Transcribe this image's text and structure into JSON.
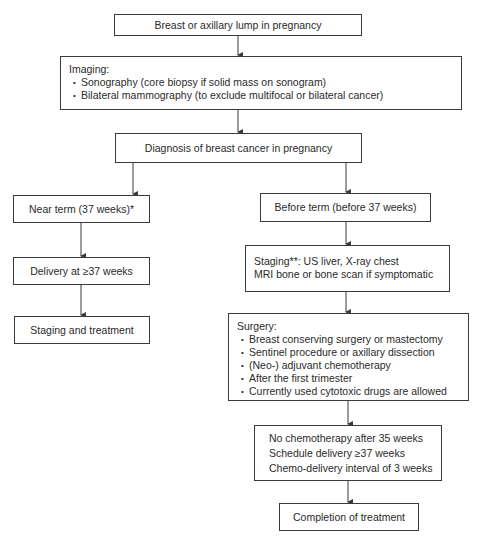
{
  "flowchart": {
    "start": {
      "label": "Breast or axillary lump in pregnancy"
    },
    "imaging": {
      "title": "Imaging:",
      "items": [
        "Sonography (core biopsy if solid mass on sonogram)",
        "Bilateral mammography (to exclude multifocal or bilateral cancer)"
      ]
    },
    "diagnosis": {
      "label": "Diagnosis of breast cancer in pregnancy"
    },
    "left_branch": {
      "near_term": "Near term (37 weeks)*",
      "delivery": "Delivery at ≥37 weeks",
      "staging_treatment": "Staging and treatment"
    },
    "right_branch": {
      "before_term": "Before term (before 37 weeks)",
      "staging": {
        "lines": [
          "Staging**: US liver, X-ray chest",
          "MRI bone or bone scan if symptomatic"
        ]
      },
      "surgery": {
        "title": "Surgery:",
        "items": [
          "Breast conserving surgery or mastectomy",
          "Sentinel procedure or axillary dissection",
          "(Neo-) adjuvant chemotherapy",
          "After the first trimester",
          "Currently used cytotoxic drugs are allowed"
        ]
      },
      "timing": {
        "lines": [
          "No chemotherapy after 35 weeks",
          "Schedule delivery ≥37 weeks",
          "Chemo-delivery interval of 3 weeks"
        ]
      },
      "completion": "Completion of treatment"
    },
    "colors": {
      "line": "#3a3a3a",
      "text": "#2a2a2a",
      "background": "#ffffff"
    }
  }
}
